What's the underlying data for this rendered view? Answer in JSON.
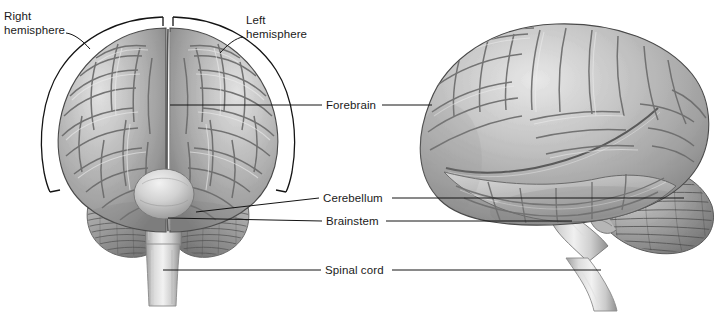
{
  "figure": {
    "background_color": "#ffffff",
    "line_color": "#1a1a1a",
    "cortex_mid_gray": "#a8a8a8",
    "cortex_highlight": "#dcdcdc",
    "cortex_sulcus": "#6e6e6e",
    "cerebellum_gray": "#8f8f8f",
    "brainstem_gray": "#cfcfcf"
  },
  "labels": {
    "right_hemisphere": {
      "line1": "Right",
      "line2": "hemisphere"
    },
    "left_hemisphere": {
      "line1": "Left",
      "line2": "hemisphere"
    },
    "forebrain": "Forebrain",
    "cerebellum": "Cerebellum",
    "brainstem": "Brainstem",
    "spinal_cord": "Spinal cord"
  },
  "views": {
    "posterior": "posterior-coronal-brain-view",
    "lateral": "lateral-brain-view"
  },
  "icons": {
    "bracket_right": "right-hemisphere-bracket",
    "bracket_left": "left-hemisphere-bracket",
    "leader": "leader-line"
  }
}
